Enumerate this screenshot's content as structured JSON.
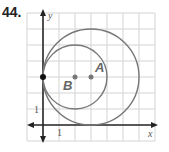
{
  "problem": {
    "number": "44."
  },
  "graph": {
    "axes": {
      "x_label": "x",
      "y_label": "y",
      "x_tick_label": "1",
      "y_tick_label": "1"
    },
    "grid": {
      "x_min": -1,
      "x_max": 7,
      "y_min": -1,
      "y_max": 7,
      "spacing": 1
    },
    "points": [
      {
        "name": "tangent-point",
        "label": "",
        "x": 0,
        "y": 3,
        "color": "#111111"
      },
      {
        "name": "point-b",
        "label": "B",
        "x": 2,
        "y": 3,
        "color": "#777777"
      },
      {
        "name": "point-a",
        "label": "A",
        "x": 3,
        "y": 3,
        "color": "#777777"
      }
    ],
    "circles": [
      {
        "name": "small-circle",
        "center": "B",
        "cx": 2,
        "cy": 3,
        "r": 2
      },
      {
        "name": "large-circle",
        "center": "A",
        "cx": 3,
        "cy": 3,
        "r": 3
      }
    ],
    "colors": {
      "grid": "#d4d4d4",
      "axis": "#222222",
      "circle": "#777777",
      "label": "#666666"
    }
  }
}
